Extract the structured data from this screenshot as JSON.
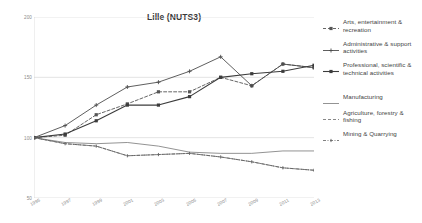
{
  "chart_data": {
    "type": "line",
    "title": "Lille (NUTS3)",
    "xlabel": "",
    "ylabel": "",
    "ylim": [
      50,
      200
    ],
    "yticks": [
      50,
      100,
      150,
      200
    ],
    "grid": "horizontal",
    "legend_position": "right",
    "x": [
      1995,
      1997,
      1999,
      2001,
      2003,
      2005,
      2007,
      2009,
      2011,
      2013
    ],
    "categories": [
      "1995",
      "1997",
      "1999",
      "2001",
      "2003",
      "2005",
      "2007",
      "2009",
      "2011",
      "2013"
    ],
    "series": [
      {
        "name": "Arts, entertainment & recreation",
        "style": "dashed-marker",
        "color": "#555555",
        "values": [
          100,
          102,
          119,
          128,
          138,
          138,
          150,
          143,
          161,
          158
        ]
      },
      {
        "name": "Administrative & support activities",
        "style": "solid-marker",
        "color": "#4d4d4d",
        "values": [
          100,
          110,
          127,
          142,
          146,
          155,
          167,
          143,
          161,
          158
        ]
      },
      {
        "name": "Professional, scientific & technical activities",
        "style": "solid-square",
        "color": "#3c3c3c",
        "values": [
          100,
          103,
          114,
          127,
          127,
          134,
          150,
          153,
          155,
          160
        ]
      },
      {
        "name": "Manufacturing",
        "style": "solid-plain",
        "color": "#777777",
        "values": [
          100,
          96,
          95,
          96,
          93,
          88,
          87,
          87,
          89,
          89
        ]
      },
      {
        "name": "Agriculture, forestry & fishing",
        "style": "dashed-plain",
        "color": "#6a6a6a",
        "values": [
          100,
          95,
          93,
          85,
          86,
          87,
          84,
          80,
          75,
          73
        ]
      },
      {
        "name": "Mining & Quarrying",
        "style": "dash-dot-marker",
        "color": "#5f5f5f",
        "values": [
          100,
          95,
          93,
          85,
          86,
          87,
          84,
          80,
          75,
          73
        ]
      }
    ]
  },
  "legend": {
    "items": [
      {
        "label": "Arts, entertainment & recreation",
        "icon": "dashed-square-marker-icon"
      },
      {
        "label": "Administrative & support activities",
        "icon": "solid-plus-marker-icon"
      },
      {
        "label": "Professional, scientific & technical activities",
        "icon": "solid-square-marker-icon"
      },
      {
        "label": "Manufacturing",
        "icon": "solid-line-icon"
      },
      {
        "label": "Agriculture, forestry & fishing",
        "icon": "dashed-line-icon"
      },
      {
        "label": "Mining & Quarrying",
        "icon": "dash-dot-marker-icon"
      }
    ]
  }
}
